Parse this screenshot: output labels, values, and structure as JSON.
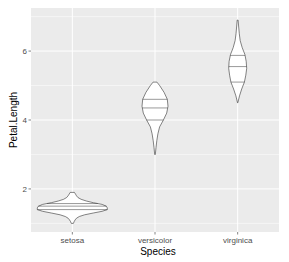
{
  "chart_data": {
    "type": "violin",
    "title": "",
    "xlabel": "Species",
    "ylabel": "Petal.Length",
    "categories": [
      "setosa",
      "versicolor",
      "virginica"
    ],
    "yticks": [
      2,
      4,
      6
    ],
    "ylim": [
      0.75,
      7.25
    ],
    "grid": true,
    "legend": null,
    "series": [
      {
        "name": "setosa",
        "min": 1.0,
        "max": 1.9,
        "quantiles": [
          1.4,
          1.5,
          1.575
        ],
        "profile": [
          [
            1.0,
            0.03
          ],
          [
            1.05,
            0.05
          ],
          [
            1.1,
            0.08
          ],
          [
            1.15,
            0.12
          ],
          [
            1.2,
            0.2
          ],
          [
            1.25,
            0.35
          ],
          [
            1.3,
            0.6
          ],
          [
            1.35,
            0.85
          ],
          [
            1.4,
            1.0
          ],
          [
            1.45,
            1.0
          ],
          [
            1.5,
            0.97
          ],
          [
            1.55,
            0.85
          ],
          [
            1.6,
            0.6
          ],
          [
            1.65,
            0.4
          ],
          [
            1.7,
            0.25
          ],
          [
            1.75,
            0.16
          ],
          [
            1.8,
            0.12
          ],
          [
            1.85,
            0.09
          ],
          [
            1.9,
            0.06
          ]
        ]
      },
      {
        "name": "versicolor",
        "min": 3.0,
        "max": 5.1,
        "quantiles": [
          4.0,
          4.35,
          4.6
        ],
        "profile": [
          [
            3.0,
            0.02
          ],
          [
            3.2,
            0.08
          ],
          [
            3.4,
            0.14
          ],
          [
            3.6,
            0.22
          ],
          [
            3.8,
            0.35
          ],
          [
            4.0,
            0.65
          ],
          [
            4.2,
            0.9
          ],
          [
            4.4,
            1.0
          ],
          [
            4.6,
            0.95
          ],
          [
            4.8,
            0.7
          ],
          [
            5.0,
            0.35
          ],
          [
            5.1,
            0.15
          ]
        ]
      },
      {
        "name": "virginica",
        "min": 4.5,
        "max": 6.9,
        "quantiles": [
          5.1,
          5.55,
          5.875
        ],
        "profile": [
          [
            4.5,
            0.02
          ],
          [
            4.7,
            0.2
          ],
          [
            4.9,
            0.45
          ],
          [
            5.1,
            0.75
          ],
          [
            5.3,
            0.9
          ],
          [
            5.5,
            1.0
          ],
          [
            5.7,
            0.95
          ],
          [
            5.9,
            0.8
          ],
          [
            6.1,
            0.5
          ],
          [
            6.3,
            0.28
          ],
          [
            6.5,
            0.18
          ],
          [
            6.7,
            0.12
          ],
          [
            6.9,
            0.05
          ]
        ]
      }
    ]
  },
  "style": {
    "panel_bg": "#ebebeb",
    "grid_color": "#ffffff",
    "violin_fill": "#ffffff",
    "violin_stroke": "#333333",
    "text_color": "#4d4d4d",
    "max_half_width_px": [
      35,
      13,
      9
    ]
  }
}
